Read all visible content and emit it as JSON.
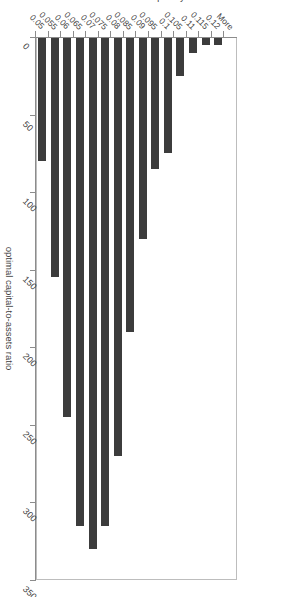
{
  "chart_data": {
    "type": "bar",
    "orientation": "vertical",
    "title": "",
    "xlabel": "optimal capital-to-assets ratio",
    "ylabel": "frequency",
    "ylim": [
      0,
      350
    ],
    "yticks": [
      0,
      50,
      100,
      150,
      200,
      250,
      300,
      350
    ],
    "grid": false,
    "legend": null,
    "bar_color": "#3c3c3c",
    "categories": [
      "0.05",
      "0.055",
      "0.06",
      "0.065",
      "0.07",
      "0.075",
      "0.08",
      "0.085",
      "0.09",
      "0.095",
      "0.1",
      "0.105",
      "0.11",
      "0.115",
      "0.12",
      "More"
    ],
    "values": [
      80,
      155,
      245,
      315,
      330,
      315,
      270,
      190,
      130,
      85,
      75,
      25,
      10,
      5,
      5,
      0
    ]
  },
  "axes": {
    "value_axis_title": "frequency",
    "category_axis_title": "optimal capital-to-assets ratio",
    "value_ticks": [
      "0",
      "50",
      "100",
      "150",
      "200",
      "250",
      "300",
      "350"
    ],
    "category_ticks": [
      "0.05",
      "0.055",
      "0.06",
      "0.065",
      "0.07",
      "0.075",
      "0.08",
      "0.085",
      "0.09",
      "0.095",
      "0.1",
      "0.105",
      "0.11",
      "0.115",
      "0.12",
      "More"
    ]
  },
  "colors": {
    "bar": "#3c3c3c",
    "axis": "#8c8c8c",
    "plot_border": "#bdbdbd",
    "background": "#ffffff",
    "text": "#3f3f3f"
  }
}
